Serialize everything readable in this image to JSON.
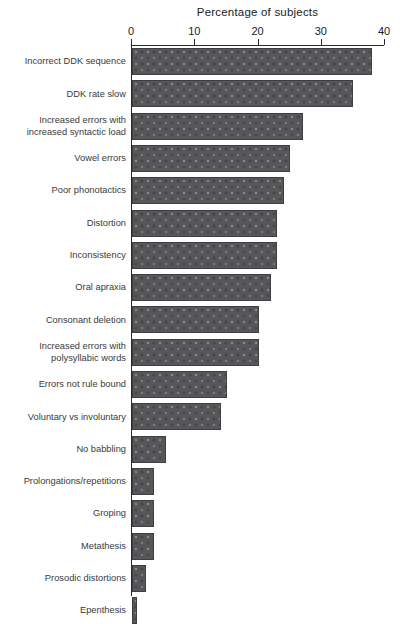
{
  "chart_data": {
    "type": "bar",
    "orientation": "horizontal",
    "title": "Percentage of subjects",
    "xlabel": "",
    "ylabel": "",
    "xlim": [
      0,
      40
    ],
    "xticks": [
      0,
      10,
      20,
      30,
      40
    ],
    "xtick_labels": [
      "0",
      "10",
      "20",
      "30",
      "40"
    ],
    "grid": false,
    "legend": false,
    "bar_color": "#57575a",
    "bar_edge_color": "#3f3f42",
    "background_color": "#ffffff",
    "categories": [
      "Incorrect DDK sequence",
      "DDK rate slow",
      "Increased errors with\nincreased syntactic load",
      "Vowel errors",
      "Poor phonotactics",
      "Distortion",
      "Inconsistency",
      "Oral apraxia",
      "Consonant deletion",
      "Increased errors with\npolysyllabic words",
      "Errors not rule bound",
      "Voluntary vs involuntary",
      "No babbling",
      "Prolongations/repetitions",
      "Groping",
      "Metathesis",
      "Prosodic distortions",
      "Epenthesis"
    ],
    "values": [
      38,
      35,
      27,
      25,
      24,
      23,
      23,
      22,
      20,
      20,
      15,
      14,
      5.4,
      3.4,
      3.4,
      3.4,
      2.2,
      0.8
    ]
  },
  "caption": {
    "text": ""
  }
}
